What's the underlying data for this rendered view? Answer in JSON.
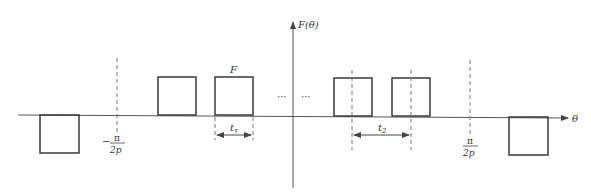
{
  "diagram": {
    "type": "periodic rectangular pulse waveform",
    "y_axis_label": "F(θ)",
    "x_axis_label": "θ",
    "pulse_amplitude_label": "F",
    "pulse_width_label": "t_τ",
    "pulse_width_label_main": "t",
    "pulse_width_label_sub": "τ",
    "spacing_label": "t_2",
    "spacing_label_main": "t",
    "spacing_label_sub": "2",
    "left_marker": {
      "sign": "−",
      "numerator": "π",
      "denominator": "2p"
    },
    "right_marker": {
      "sign": "",
      "numerator": "π",
      "denominator": "2p"
    },
    "ellipsis_left": "···",
    "ellipsis_right": "···",
    "pulses": [
      {
        "position": "far-left",
        "polarity": "negative"
      },
      {
        "position": "left-2",
        "polarity": "positive"
      },
      {
        "position": "left-1",
        "polarity": "positive",
        "labeled": "F"
      },
      {
        "position": "right-1",
        "polarity": "positive"
      },
      {
        "position": "right-2",
        "polarity": "positive"
      },
      {
        "position": "far-right",
        "polarity": "negative"
      }
    ]
  }
}
